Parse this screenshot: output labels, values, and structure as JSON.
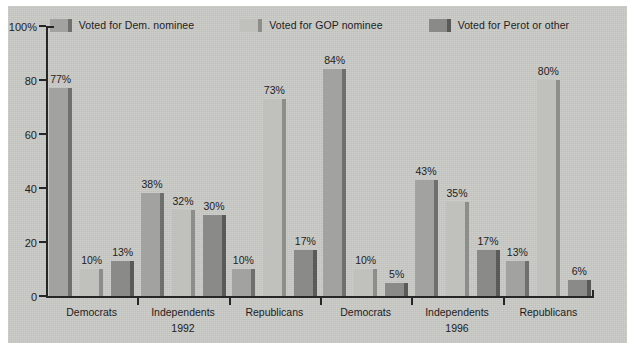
{
  "colors": {
    "plate_background": "#c9c9c6",
    "page_background": "#ffffff",
    "axis": "#262626",
    "text": "#1d1d1d",
    "dem_fill": "#a2a2a0",
    "dem_edge": "#6f6f6d",
    "gop_fill": "#c0c0bd",
    "gop_edge": "#8d8d8a",
    "perot_fill": "#8a8a88",
    "perot_edge": "#5a5a58"
  },
  "legend": {
    "items": [
      {
        "label": "Voted for Dem. nominee",
        "swatch": "dem"
      },
      {
        "label": "Voted for GOP nominee",
        "swatch": "gop"
      },
      {
        "label": "Voted for Perot or other",
        "swatch": "perot"
      }
    ]
  },
  "axis": {
    "y_ticks": [
      "100%",
      "80",
      "60",
      "40",
      "20",
      "0"
    ],
    "y_values": [
      100,
      80,
      60,
      40,
      20,
      0
    ],
    "y_max": 100
  },
  "groups": [
    {
      "category": "Democrats",
      "year": "1992",
      "values": [
        77,
        10,
        13
      ],
      "labels": [
        "77%",
        "10%",
        "13%"
      ]
    },
    {
      "category": "Independents",
      "year": "1992",
      "values": [
        38,
        32,
        30
      ],
      "labels": [
        "38%",
        "32%",
        "30%"
      ]
    },
    {
      "category": "Republicans",
      "year": "1992",
      "values": [
        10,
        73,
        17
      ],
      "labels": [
        "10%",
        "73%",
        "17%"
      ]
    },
    {
      "category": "Democrats",
      "year": "1996",
      "values": [
        84,
        10,
        5
      ],
      "labels": [
        "84%",
        "10%",
        "5%"
      ]
    },
    {
      "category": "Independents",
      "year": "1996",
      "values": [
        43,
        35,
        17
      ],
      "labels": [
        "43%",
        "35%",
        "17%"
      ]
    },
    {
      "category": "Republicans",
      "year": "1996",
      "values": [
        13,
        80,
        6
      ],
      "labels": [
        "13%",
        "80%",
        "6%"
      ]
    }
  ],
  "year_labels": [
    {
      "text": "1992",
      "under_group_index": 1
    },
    {
      "text": "1996",
      "under_group_index": 4
    }
  ],
  "chart_data": {
    "type": "bar",
    "title": "",
    "subtitle": "",
    "xlabel": "",
    "ylabel": "",
    "ylim": [
      0,
      100
    ],
    "ytick_labels": [
      "0",
      "20",
      "40",
      "60",
      "80",
      "100%"
    ],
    "grid": false,
    "legend_position": "top-center",
    "categories": [
      "Democrats 1992",
      "Independents 1992",
      "Republicans 1992",
      "Democrats 1996",
      "Independents 1996",
      "Republicans 1996"
    ],
    "series": [
      {
        "name": "Voted for Dem. nominee",
        "values": [
          77,
          38,
          10,
          84,
          43,
          13
        ]
      },
      {
        "name": "Voted for GOP nominee",
        "values": [
          10,
          32,
          73,
          10,
          35,
          80
        ]
      },
      {
        "name": "Voted for Perot or other",
        "values": [
          13,
          30,
          17,
          5,
          17,
          6
        ]
      }
    ],
    "annotations": [
      "77%",
      "10%",
      "13%",
      "38%",
      "32%",
      "30%",
      "10%",
      "73%",
      "17%",
      "84%",
      "10%",
      "5%",
      "43%",
      "35%",
      "17%",
      "13%",
      "80%",
      "6%"
    ],
    "group_separators": [
      "1992",
      "1996"
    ]
  }
}
